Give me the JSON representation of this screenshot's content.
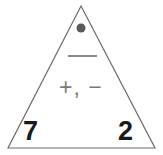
{
  "figure": {
    "type": "number-triangle",
    "background_color": "#ffffff",
    "outline_color": "#6b6b6b",
    "outline_width": 1.2,
    "apex": {
      "x": 81,
      "y": 6
    },
    "bottom_left": {
      "x": 8,
      "y": 148
    },
    "bottom_right": {
      "x": 155,
      "y": 148
    }
  },
  "top": {
    "dot": {
      "icon": "filled-circle-icon",
      "color": "#5a5a5a",
      "center_x": 81,
      "center_y": 28,
      "radius": 4.5
    },
    "answer_blank": {
      "label": "",
      "line_color": "#6b6b6b",
      "x1": 68,
      "x2": 97,
      "y": 56,
      "thickness": 1.6
    }
  },
  "middle": {
    "operators_text": "+, −",
    "operators_color": "#7a7a7a"
  },
  "corners": {
    "left_value": "7",
    "right_value": "2",
    "value_color": "#1a1a1a"
  }
}
